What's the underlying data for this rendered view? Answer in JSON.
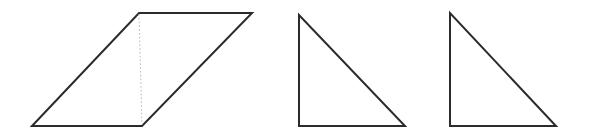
{
  "figure": {
    "canvas": {
      "width": 589,
      "height": 137,
      "background": "#ffffff"
    },
    "style": {
      "outline_color": "#2b2b2b",
      "outline_width": 2,
      "divider_color": "#b9b9b9",
      "divider_width": 1,
      "divider_dash": "1.6 2.2"
    },
    "shapes": [
      {
        "name": "parallelogram",
        "type": "polygon",
        "points": "32,126 139,13 252,13 142,126",
        "fill": "none"
      },
      {
        "name": "parallelogram-divider",
        "type": "polyline",
        "points": "139,14 142,125",
        "fill": "none"
      },
      {
        "name": "middle-right-triangle",
        "type": "polygon",
        "points": "299,15 299,126 405,126",
        "fill": "none"
      },
      {
        "name": "right-right-triangle",
        "type": "polygon",
        "points": "450,13 450,126 556,126",
        "fill": "none"
      }
    ]
  }
}
